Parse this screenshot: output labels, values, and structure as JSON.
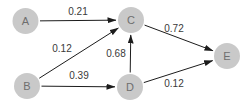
{
  "diagram": {
    "type": "directed-graph",
    "background": "#ffffff",
    "colors": {
      "node_fill": "#c9c9c9",
      "node_label": "#6e6e6e",
      "edge": "#1c1c1c",
      "edge_label": "#3a3a3a"
    },
    "node_radius": 13,
    "nodes": [
      {
        "id": "A",
        "label": "A",
        "x": 25.5,
        "y": 21
      },
      {
        "id": "B",
        "label": "B",
        "x": 27,
        "y": 86
      },
      {
        "id": "C",
        "label": "C",
        "x": 131,
        "y": 20
      },
      {
        "id": "D",
        "label": "D",
        "x": 130,
        "y": 87
      },
      {
        "id": "E",
        "label": "E",
        "x": 227,
        "y": 56
      }
    ],
    "edges": [
      {
        "from": "A",
        "to": "C",
        "weight": "0.21",
        "label": {
          "x": 78,
          "y": 15
        }
      },
      {
        "from": "B",
        "to": "C",
        "weight": "0.12",
        "label": {
          "x": 62,
          "y": 52
        }
      },
      {
        "from": "B",
        "to": "D",
        "weight": "0.39",
        "label": {
          "x": 79,
          "y": 79
        }
      },
      {
        "from": "D",
        "to": "C",
        "weight": "0.68",
        "label": {
          "x": 116,
          "y": 57
        }
      },
      {
        "from": "C",
        "to": "E",
        "weight": "0.72",
        "label": {
          "x": 174,
          "y": 32
        }
      },
      {
        "from": "D",
        "to": "E",
        "weight": "0.12",
        "label": {
          "x": 174,
          "y": 87
        }
      }
    ]
  }
}
